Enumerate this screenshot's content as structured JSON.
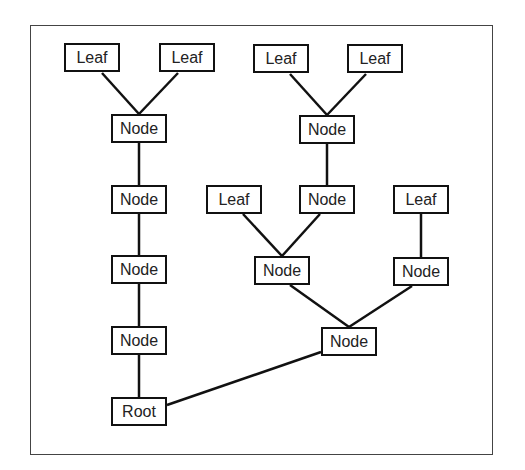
{
  "diagram": {
    "type": "tree",
    "nodes": [
      {
        "id": "leaf1",
        "label": "Leaf",
        "x": 64,
        "y": 43
      },
      {
        "id": "leaf2",
        "label": "Leaf",
        "x": 159,
        "y": 43
      },
      {
        "id": "nodeA",
        "label": "Node",
        "x": 111,
        "y": 114
      },
      {
        "id": "nodeA2",
        "label": "Node",
        "x": 111,
        "y": 185
      },
      {
        "id": "nodeA3",
        "label": "Node",
        "x": 111,
        "y": 255
      },
      {
        "id": "nodeA4",
        "label": "Node",
        "x": 111,
        "y": 326
      },
      {
        "id": "root",
        "label": "Root",
        "x": 111,
        "y": 397
      },
      {
        "id": "leaf3",
        "label": "Leaf",
        "x": 253,
        "y": 44
      },
      {
        "id": "leaf4",
        "label": "Leaf",
        "x": 347,
        "y": 44
      },
      {
        "id": "nodeB",
        "label": "Node",
        "x": 299,
        "y": 115
      },
      {
        "id": "nodeC",
        "label": "Node",
        "x": 299,
        "y": 185
      },
      {
        "id": "leaf5",
        "label": "Leaf",
        "x": 206,
        "y": 185
      },
      {
        "id": "leaf6",
        "label": "Leaf",
        "x": 393,
        "y": 185
      },
      {
        "id": "nodeD",
        "label": "Node",
        "x": 254,
        "y": 256
      },
      {
        "id": "nodeE",
        "label": "Node",
        "x": 393,
        "y": 257
      },
      {
        "id": "nodeF",
        "label": "Node",
        "x": 321,
        "y": 327
      }
    ],
    "edges": [
      [
        "leaf1",
        "nodeA"
      ],
      [
        "leaf2",
        "nodeA"
      ],
      [
        "nodeA",
        "nodeA2"
      ],
      [
        "nodeA2",
        "nodeA3"
      ],
      [
        "nodeA3",
        "nodeA4"
      ],
      [
        "nodeA4",
        "root"
      ],
      [
        "leaf3",
        "nodeB"
      ],
      [
        "leaf4",
        "nodeB"
      ],
      [
        "nodeB",
        "nodeC"
      ],
      [
        "leaf5",
        "nodeD"
      ],
      [
        "nodeC",
        "nodeD"
      ],
      [
        "leaf6",
        "nodeE"
      ],
      [
        "nodeD",
        "nodeF"
      ],
      [
        "nodeE",
        "nodeF"
      ],
      [
        "nodeF",
        "root"
      ]
    ]
  }
}
